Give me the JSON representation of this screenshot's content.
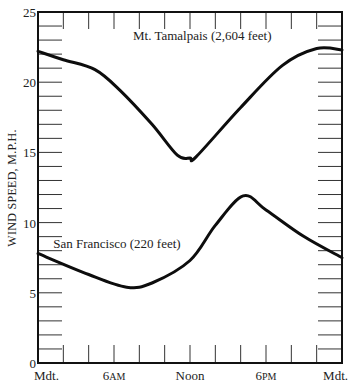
{
  "chart_data": {
    "type": "line",
    "title": "",
    "xlabel": "",
    "ylabel": "WIND SPEED, M.P.H.",
    "ylim": [
      0,
      25
    ],
    "xlim": [
      0,
      24
    ],
    "y_ticks": [
      0,
      5,
      10,
      15,
      20,
      25
    ],
    "x_tick_labels": [
      {
        "x": 0,
        "label": "Mdt."
      },
      {
        "x": 6,
        "label": "6AM"
      },
      {
        "x": 12,
        "label": "Noon"
      },
      {
        "x": 18,
        "label": "6PM"
      },
      {
        "x": 24,
        "label": "Mdt."
      }
    ],
    "x_minor_tick_interval_hours": 2,
    "y_minor_tick_interval": 1,
    "grid": false,
    "legend": "inline labels",
    "series": [
      {
        "name": "Mt. Tamalpais (2,604 feet)",
        "label_pos": {
          "x": 7.5,
          "y": 23
        },
        "x": [
          0,
          2,
          4.5,
          6.5,
          9,
          11,
          12,
          12.5,
          16,
          19.3,
          22,
          24
        ],
        "values": [
          22.2,
          21.6,
          20.9,
          19.4,
          17.0,
          14.8,
          14.6,
          14.7,
          18.2,
          21.2,
          22.4,
          22.3
        ]
      },
      {
        "name": "San Francisco (220 feet)",
        "label_pos": {
          "x": 1.2,
          "y": 8.2
        },
        "x": [
          0,
          4,
          7,
          9,
          12,
          14,
          16.2,
          18,
          21,
          24
        ],
        "values": [
          7.8,
          6.3,
          5.4,
          5.7,
          7.3,
          9.8,
          11.9,
          10.9,
          9.0,
          7.5
        ]
      }
    ]
  }
}
